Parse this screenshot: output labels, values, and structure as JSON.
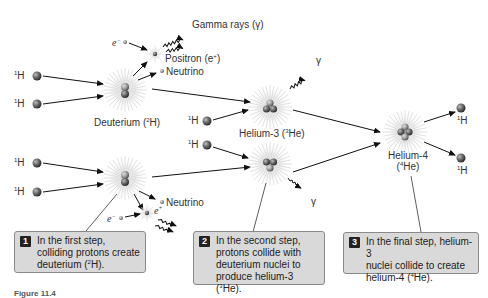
{
  "labels": {
    "h1_a": "H",
    "h1_sup": "1",
    "deuterium": "Deuterium (",
    "deuterium_sup": "2",
    "deuterium_end": "H)",
    "helium3": "Helium-3 (",
    "helium3_sup": "3",
    "helium3_end": "He)",
    "helium4_line1": "Helium-4",
    "helium4_line2_pre": "(",
    "helium4_sup": "4",
    "helium4_line2_end": "He)",
    "gamma_rays": "Gamma rays (γ)",
    "positron": "Positron (e",
    "positron_sup": "+",
    "positron_end": ")",
    "neutrino": "Neutrino",
    "electron": "e",
    "electron_sup": "−",
    "positron_short": "e",
    "positron_short_sup": "+",
    "gamma": "γ"
  },
  "steps": [
    {
      "num": "1",
      "text_1": "In the first step,",
      "text_2": "colliding protons create",
      "text_3_pre": "deuterium (",
      "text_3_sup": "2",
      "text_3_end": "H)."
    },
    {
      "num": "2",
      "text_1": "In the second step,",
      "text_2": "protons collide with",
      "text_3": "deuterium nuclei to",
      "text_4_pre": "produce helium-3 (",
      "text_4_sup": "3",
      "text_4_end": "He)."
    },
    {
      "num": "3",
      "text_1": "In the final step, helium-3",
      "text_2": "nuclei collide to create",
      "text_3_pre": "helium-4 (",
      "text_3_sup": "4",
      "text_3_end": "He)."
    }
  ],
  "caption": "Figure 11.4"
}
